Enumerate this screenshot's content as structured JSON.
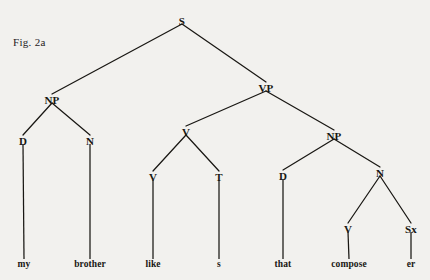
{
  "figure": {
    "caption": "Fig. 2a",
    "background_color": "#f2f1ee",
    "ink_color": "#191713"
  },
  "chart_data": {
    "type": "diagram",
    "subtype": "syntactic-constituency-tree",
    "title": "Fig. 2a",
    "sentence": "my brother likes that composer",
    "nodes": [
      {
        "id": "S",
        "label": "S",
        "x": 182,
        "y": 21,
        "level": 0
      },
      {
        "id": "NP1",
        "label": "NP",
        "x": 52,
        "y": 100,
        "level": 1
      },
      {
        "id": "VP",
        "label": "VP",
        "x": 266,
        "y": 88,
        "level": 1
      },
      {
        "id": "D1",
        "label": "D",
        "x": 23,
        "y": 141,
        "level": 2
      },
      {
        "id": "N1",
        "label": "N",
        "x": 90,
        "y": 141,
        "level": 2
      },
      {
        "id": "V1",
        "label": "V",
        "x": 186,
        "y": 132,
        "level": 2
      },
      {
        "id": "NP2",
        "label": "NP",
        "x": 334,
        "y": 136,
        "level": 2
      },
      {
        "id": "V2",
        "label": "V",
        "x": 153,
        "y": 177,
        "level": 3
      },
      {
        "id": "T",
        "label": "T",
        "x": 219,
        "y": 177,
        "level": 3
      },
      {
        "id": "D2",
        "label": "D",
        "x": 283,
        "y": 176,
        "level": 3
      },
      {
        "id": "N2",
        "label": "N",
        "x": 380,
        "y": 173,
        "level": 3
      },
      {
        "id": "V3",
        "label": "V",
        "x": 348,
        "y": 229,
        "level": 4
      },
      {
        "id": "Sx",
        "label": "Sx",
        "x": 411,
        "y": 229,
        "level": 4
      }
    ],
    "edges": [
      {
        "from": "S",
        "to": "NP1"
      },
      {
        "from": "S",
        "to": "VP"
      },
      {
        "from": "NP1",
        "to": "D1"
      },
      {
        "from": "NP1",
        "to": "N1"
      },
      {
        "from": "VP",
        "to": "V1"
      },
      {
        "from": "VP",
        "to": "NP2"
      },
      {
        "from": "V1",
        "to": "V2"
      },
      {
        "from": "V1",
        "to": "T"
      },
      {
        "from": "NP2",
        "to": "D2"
      },
      {
        "from": "NP2",
        "to": "N2"
      },
      {
        "from": "N2",
        "to": "V3"
      },
      {
        "from": "N2",
        "to": "Sx"
      }
    ],
    "leaves": [
      {
        "id": "leaf-my",
        "parent": "D1",
        "label": "my",
        "x": 24,
        "y": 267
      },
      {
        "id": "leaf-brother",
        "parent": "N1",
        "label": "brother",
        "x": 90,
        "y": 267
      },
      {
        "id": "leaf-like",
        "parent": "V2",
        "label": "like",
        "x": 153,
        "y": 267
      },
      {
        "id": "leaf-s",
        "parent": "T",
        "label": "s",
        "x": 219,
        "y": 267
      },
      {
        "id": "leaf-that",
        "parent": "D2",
        "label": "that",
        "x": 283,
        "y": 267
      },
      {
        "id": "leaf-compose",
        "parent": "V3",
        "label": "compose",
        "x": 349,
        "y": 267
      },
      {
        "id": "leaf-er",
        "parent": "Sx",
        "label": "er",
        "x": 411,
        "y": 267
      }
    ],
    "node_labels": [
      "S",
      "NP",
      "VP",
      "D",
      "N",
      "V",
      "NP",
      "V",
      "T",
      "D",
      "N",
      "V",
      "Sx"
    ],
    "leaf_labels": [
      "my",
      "brother",
      "like",
      "s",
      "that",
      "compose",
      "er"
    ]
  }
}
